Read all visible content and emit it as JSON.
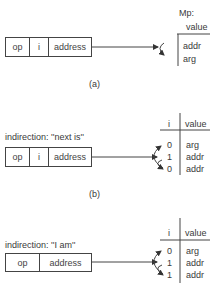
{
  "figure_a": {
    "instruction": {
      "fields": [
        "op",
        "i",
        "address"
      ]
    },
    "memory_label": "Mp:",
    "table_header": "value",
    "rows": [
      "addr",
      "arg"
    ],
    "caption": "(a)"
  },
  "figure_b": {
    "label": "indirection:  ''next is''",
    "instruction": {
      "fields": [
        "op",
        "i",
        "address"
      ]
    },
    "table_headers": [
      "i",
      "value"
    ],
    "rows": [
      {
        "i": "0",
        "value": "arg"
      },
      {
        "i": "1",
        "value": "addr"
      },
      {
        "i": "0",
        "value": "addr"
      }
    ],
    "caption": "(b)"
  },
  "figure_c": {
    "label": "indirection:  ''I am''",
    "instruction": {
      "fields": [
        "op",
        "address"
      ]
    },
    "table_headers": [
      "i",
      "value"
    ],
    "rows": [
      {
        "i": "0",
        "value": "arg"
      },
      {
        "i": "1",
        "value": "addr"
      },
      {
        "i": "1",
        "value": "addr"
      }
    ]
  },
  "colors": {
    "line": "#444444",
    "text": "#3a3a3a"
  }
}
